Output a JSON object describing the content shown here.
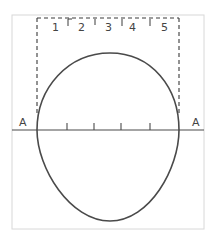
{
  "diagram": {
    "section_labels": [
      "1",
      "2",
      "3",
      "4",
      "5"
    ],
    "axis_label_left": "A",
    "axis_label_right": "A",
    "colors": {
      "frame": "#d8d8d8",
      "stroke": "#4a4a4a",
      "dashed": "#3a3a3a",
      "text": "#444444"
    }
  }
}
